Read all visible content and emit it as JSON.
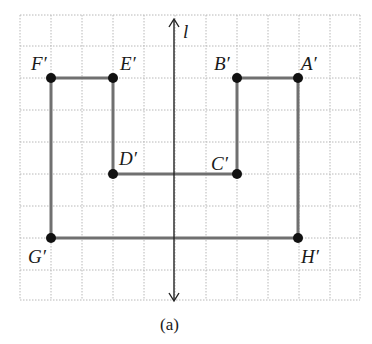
{
  "figure": {
    "caption": "(a)",
    "axis_label": "l",
    "colors": {
      "grid": "#b8b8b8",
      "segment": "#707070",
      "point": "#111111",
      "axis": "#222222"
    },
    "grid": {
      "x0": 20,
      "y0": 15,
      "cols": 11,
      "rows": 9,
      "cell": 31
    }
  },
  "points": [
    {
      "id": "A",
      "label": "A′",
      "x": 298,
      "y": 78
    },
    {
      "id": "B",
      "label": "B′",
      "x": 237,
      "y": 78
    },
    {
      "id": "C",
      "label": "C′",
      "x": 237,
      "y": 174
    },
    {
      "id": "D",
      "label": "D′",
      "x": 113,
      "y": 174
    },
    {
      "id": "E",
      "label": "E′",
      "x": 113,
      "y": 78
    },
    {
      "id": "F",
      "label": "F′",
      "x": 51,
      "y": 78
    },
    {
      "id": "G",
      "label": "G′",
      "x": 51,
      "y": 238
    },
    {
      "id": "H",
      "label": "H′",
      "x": 298,
      "y": 238
    }
  ],
  "segments": [
    [
      "A",
      "B"
    ],
    [
      "B",
      "C"
    ],
    [
      "C",
      "D"
    ],
    [
      "D",
      "E"
    ],
    [
      "E",
      "F"
    ],
    [
      "F",
      "G"
    ],
    [
      "G",
      "H"
    ],
    [
      "H",
      "A"
    ]
  ]
}
